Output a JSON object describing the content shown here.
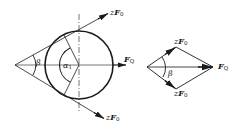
{
  "figure_left": {
    "title": "Belt pull on pulley",
    "labels": {
      "top_force_prefix": "z",
      "top_force_symbol": "F",
      "top_force_sub": "0",
      "bottom_force_prefix": "z",
      "bottom_force_symbol": "F",
      "bottom_force_sub": "0",
      "axial_force_symbol": "F",
      "axial_force_sub": "Q",
      "angle_beta": "β",
      "angle_alpha": "α",
      "angle_alpha_sub": "1"
    }
  },
  "figure_right": {
    "title": "Force parallelogram",
    "labels": {
      "top_force_prefix": "z",
      "top_force_symbol": "F",
      "top_force_sub": "0",
      "bottom_force_prefix": "z",
      "bottom_force_symbol": "F",
      "bottom_force_sub": "0",
      "resultant_symbol": "F",
      "resultant_sub": "Q",
      "angle_beta": "β"
    }
  },
  "colors": {
    "stroke": "#1a1a1a",
    "background": "#ffffff"
  }
}
